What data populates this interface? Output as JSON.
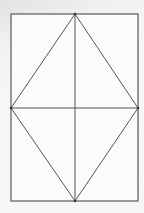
{
  "diagram": {
    "title": "",
    "shapes": [
      "rectangle",
      "rhombus",
      "vertical-diagonal",
      "horizontal-diagonal"
    ],
    "colors": {
      "stroke": "#555555",
      "frame": "#666666",
      "background": "#f4f4f4"
    }
  }
}
